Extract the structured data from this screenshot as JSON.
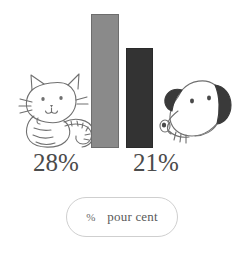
{
  "chart_data": {
    "type": "bar",
    "title": "",
    "xlabel": "",
    "ylabel": "",
    "categories": [
      "chat",
      "chien"
    ],
    "values": [
      28,
      21
    ],
    "value_labels": [
      "28%",
      "21%"
    ],
    "unit": "%",
    "ylim": [
      0,
      31
    ],
    "grid": false,
    "legend_position": "bottom",
    "series": [
      {
        "name": "pour cent",
        "values": [
          28,
          21
        ]
      }
    ],
    "bars": [
      {
        "category": "chat",
        "value": 28,
        "label": "28%",
        "color": "#8a8a8a",
        "icon": "cat-illustration"
      },
      {
        "category": "chien",
        "value": 21,
        "label": "21%",
        "color": "#333333",
        "icon": "dog-illustration"
      }
    ]
  },
  "bars": {
    "cat": {
      "label": "28%",
      "color": "#8a8a8a",
      "border_color": "#6d6d6d"
    },
    "dog": {
      "label": "21%",
      "color": "#333333",
      "border_color": "#2a2a2a"
    }
  },
  "legend": {
    "symbol": "%",
    "text": "pour cent"
  },
  "colors": {
    "background": "#ffffff",
    "text": "#4b4b4b",
    "line_art": "#6f6f6f",
    "pill_border": "#cfcfcf"
  }
}
